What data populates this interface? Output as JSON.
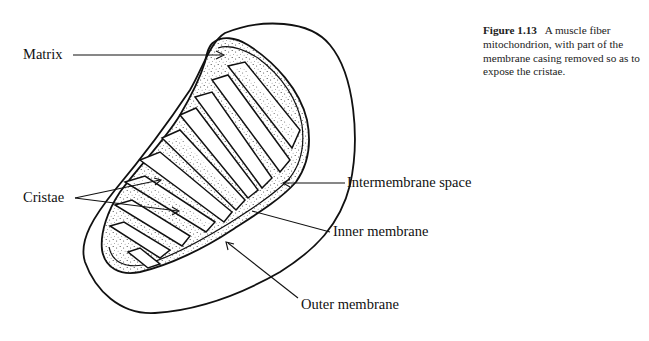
{
  "figure": {
    "number": "Figure 1.13",
    "caption": "A muscle fiber mitochondrion, with part of the membrane casing removed so as to expose the cristae."
  },
  "labels": {
    "matrix": "Matrix",
    "cristae": "Cristae",
    "intermembrane_space": "Intermembrane space",
    "inner_membrane": "Inner membrane",
    "outer_membrane": "Outer membrane"
  },
  "colors": {
    "ink": "#111111",
    "background": "#ffffff"
  }
}
